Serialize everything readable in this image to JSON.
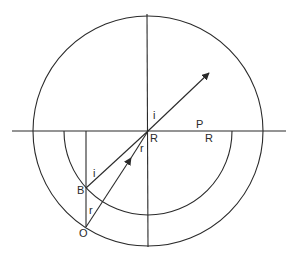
{
  "diagram": {
    "type": "refraction-geometry",
    "labels": {
      "angle_i_top": "i",
      "point_R_center": "R",
      "angle_r_center": "r",
      "point_P": "P",
      "radius_R": "R",
      "angle_i_at_B": "i",
      "point_B": "B",
      "angle_r_at_O": "r",
      "point_O": "O"
    },
    "colors": {
      "line": "#2a2a2a",
      "background": "#ffffff"
    },
    "geometry": {
      "center": [
        148,
        131
      ],
      "outer_radius": 115,
      "inner_radius": 84,
      "horizontal_axis": [
        [
          12,
          131
        ],
        [
          286,
          131
        ]
      ],
      "vertical_axis": [
        [
          147,
          14
        ],
        [
          148,
          247
        ]
      ],
      "point_B": [
        86,
        188
      ],
      "point_O": [
        86,
        227
      ],
      "ray_tip": [
        209,
        73
      ]
    }
  }
}
